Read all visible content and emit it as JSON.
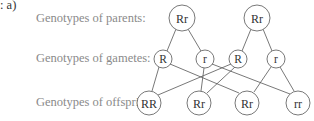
{
  "part_label": ": a)",
  "rows": {
    "parents": "Genotypes of parents:",
    "gametes": "Genotypes of gametes:",
    "offspring": "Genotypes of offspring:"
  },
  "nodes": {
    "parents": [
      {
        "label": "Rr",
        "x": 182,
        "y": 18
      },
      {
        "label": "Rr",
        "x": 257,
        "y": 18
      }
    ],
    "gametes": [
      {
        "label": "R",
        "x": 163,
        "y": 59
      },
      {
        "label": "r",
        "x": 205,
        "y": 59
      },
      {
        "label": "R",
        "x": 238,
        "y": 59
      },
      {
        "label": "r",
        "x": 276,
        "y": 59
      }
    ],
    "offspring": [
      {
        "label": "RR",
        "x": 149,
        "y": 103
      },
      {
        "label": "Rr",
        "x": 199,
        "y": 103
      },
      {
        "label": "Rr",
        "x": 247,
        "y": 103
      },
      {
        "label": "rr",
        "x": 298,
        "y": 103
      }
    ]
  },
  "colors": {
    "line": "#555555",
    "label_text": "#8a8a8a",
    "node_text": "#333333"
  }
}
